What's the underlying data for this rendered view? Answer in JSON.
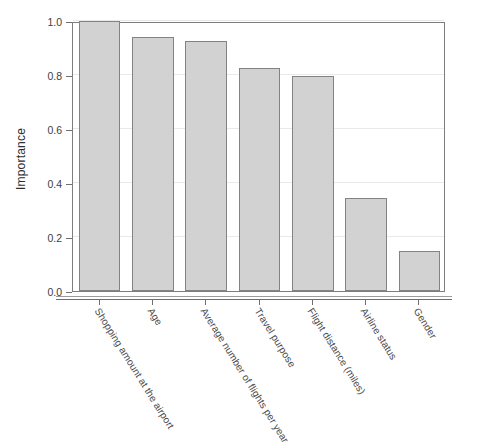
{
  "chart_data": {
    "type": "bar",
    "title": "",
    "xlabel": "",
    "ylabel": "Importance",
    "ylim": [
      0.0,
      1.0
    ],
    "grid": true,
    "legend": "none",
    "orientation": "vertical",
    "bar_fill_color": "#d2d2d2",
    "bar_border_color": "#838383",
    "categories": [
      "Shopping amount at the airport",
      "Age",
      "Average number of flights per year",
      "Travel purpose",
      "Flight distance (miles)",
      "Airline status",
      "Gender"
    ],
    "values": [
      1.0,
      0.94,
      0.925,
      0.825,
      0.795,
      0.345,
      0.15
    ],
    "ytick_labels": [
      "0.0",
      "0.2",
      "0.4",
      "0.6",
      "0.8",
      "1.0"
    ],
    "ytick_values": [
      0.0,
      0.2,
      0.4,
      0.6,
      0.8,
      1.0
    ]
  }
}
